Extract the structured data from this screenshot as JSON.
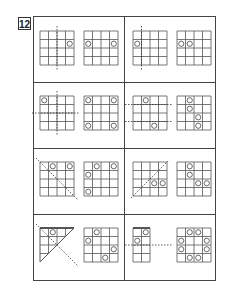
{
  "problem_number": "12",
  "grid_size": 4,
  "cell_px": 8.5,
  "colors": {
    "line": "#555555",
    "circle": "#444444",
    "border": "#444444"
  },
  "rows": [
    {
      "cells": [
        {
          "question": {
            "shape": "square",
            "fold_lines": [
              {
                "type": "vertical",
                "at": 2
              }
            ],
            "circles": [
              [
                2,
                4
              ]
            ]
          },
          "answer": {
            "circles": [
              [
                2,
                1
              ],
              [
                2,
                4
              ]
            ]
          }
        },
        {
          "question": {
            "shape": "square",
            "fold_lines": [
              {
                "type": "vertical",
                "at": 1
              }
            ],
            "circles": [
              [
                2,
                1
              ]
            ]
          },
          "answer": {
            "circles": [
              [
                2,
                1
              ],
              [
                2,
                2
              ]
            ]
          }
        }
      ]
    },
    {
      "cells": [
        {
          "question": {
            "shape": "square",
            "fold_lines": [
              {
                "type": "vertical",
                "at": 2
              },
              {
                "type": "horizontal",
                "at": 2
              }
            ],
            "circles": [
              [
                1,
                1
              ]
            ]
          },
          "answer": {
            "circles": [
              [
                1,
                1
              ],
              [
                1,
                4
              ],
              [
                4,
                1
              ],
              [
                4,
                4
              ]
            ]
          }
        },
        {
          "question": {
            "shape": "square",
            "fold_lines": [
              {
                "type": "horizontal",
                "at": 1
              },
              {
                "type": "horizontal",
                "at": 3
              }
            ],
            "circles": [
              [
                1,
                2
              ],
              [
                4,
                3
              ]
            ]
          },
          "answer": {
            "circles": [
              [
                1,
                2
              ],
              [
                2,
                2
              ],
              [
                3,
                3
              ],
              [
                4,
                3
              ]
            ]
          }
        }
      ]
    },
    {
      "cells": [
        {
          "question": {
            "shape": "square",
            "fold_lines": [
              {
                "type": "diag-down"
              }
            ],
            "circles": [
              [
                1,
                2
              ],
              [
                1,
                4
              ]
            ]
          },
          "answer": {
            "circles": [
              [
                1,
                2
              ],
              [
                1,
                4
              ],
              [
                2,
                1
              ],
              [
                4,
                1
              ]
            ]
          }
        },
        {
          "question": {
            "shape": "square",
            "fold_lines": [
              {
                "type": "diag-up"
              }
            ],
            "circles": [
              [
                3,
                3
              ],
              [
                3,
                4
              ]
            ]
          },
          "answer": {
            "circles": [
              [
                1,
                2
              ],
              [
                2,
                2
              ],
              [
                3,
                3
              ],
              [
                3,
                4
              ]
            ]
          }
        }
      ]
    },
    {
      "cells": [
        {
          "question": {
            "shape": "triangle",
            "fold_lines": [
              {
                "type": "diag-down"
              }
            ],
            "circles": [
              [
                1,
                2
              ]
            ]
          },
          "answer": {
            "circles": [
              [
                1,
                2
              ],
              [
                2,
                1
              ],
              [
                3,
                4
              ],
              [
                4,
                3
              ]
            ]
          }
        },
        {
          "question": {
            "shape": "half",
            "fold_lines": [
              {
                "type": "horizontal",
                "at": 2
              }
            ],
            "circles": [
              [
                1,
                2
              ],
              [
                2,
                1
              ]
            ]
          },
          "answer": {
            "circles": [
              [
                1,
                2
              ],
              [
                1,
                3
              ],
              [
                2,
                1
              ],
              [
                2,
                4
              ],
              [
                3,
                1
              ],
              [
                3,
                4
              ],
              [
                4,
                2
              ],
              [
                4,
                3
              ]
            ]
          }
        }
      ]
    }
  ]
}
